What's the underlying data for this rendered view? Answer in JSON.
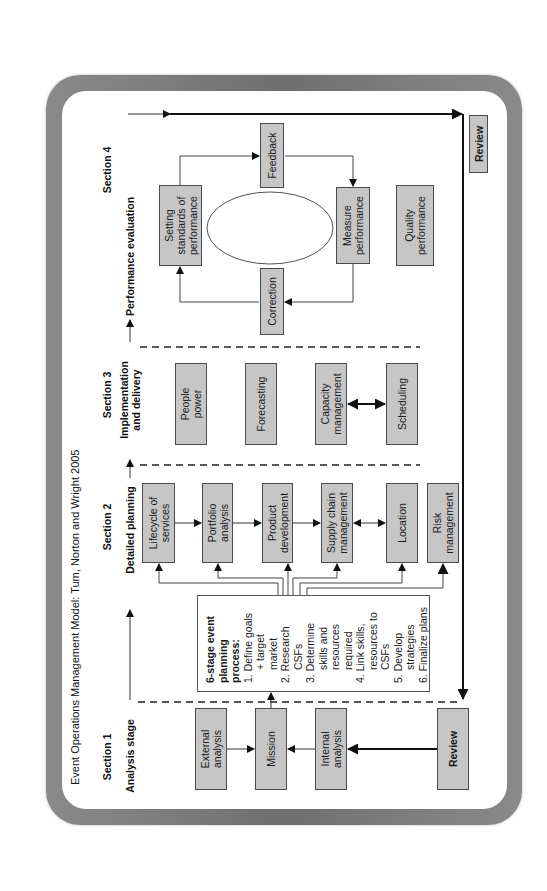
{
  "title": "Event Operations Management Model: Tum, Norton and Wright 2005",
  "sections": [
    {
      "label": "Section 1",
      "stage": "Analysis stage"
    },
    {
      "label": "Section 2",
      "stage": "Detailed planning"
    },
    {
      "label": "Section 3",
      "stage_line1": "Implementation",
      "stage_line2": "and delivery"
    },
    {
      "label": "Section 4",
      "stage": "Performance evaluation"
    }
  ],
  "section1": {
    "boxes": [
      {
        "line1": "External",
        "line2": "analysis"
      },
      {
        "line1": "Mission"
      },
      {
        "line1": "Internal",
        "line2": "analysis"
      },
      {
        "line1": "Review"
      }
    ]
  },
  "planning_process": {
    "heading_line1": "6-stage event",
    "heading_line2": "planning",
    "heading_line3": "process:",
    "steps": [
      {
        "num": "1.",
        "text": "Define goals + target market"
      },
      {
        "num": "2.",
        "text": "Research CSFs"
      },
      {
        "num": "3.",
        "text": "Determine skills and resources required"
      },
      {
        "num": "4.",
        "text": "Link skills, resources to CSFs"
      },
      {
        "num": "5.",
        "text": "Develop strategies"
      },
      {
        "num": "6.",
        "text": "Finalize plans"
      }
    ]
  },
  "section2": {
    "boxes": [
      {
        "line1": "Lifecycle of",
        "line2": "services"
      },
      {
        "line1": "Portfolio",
        "line2": "analysis"
      },
      {
        "line1": "Product",
        "line2": "development"
      },
      {
        "line1": "Supply chain",
        "line2": "management"
      },
      {
        "line1": "Location"
      },
      {
        "line1": "Risk",
        "line2": "management"
      }
    ]
  },
  "section3": {
    "boxes": [
      {
        "line1": "People",
        "line2": "power"
      },
      {
        "line1": "Forecasting"
      },
      {
        "line1": "Capacity",
        "line2": "management"
      },
      {
        "line1": "Scheduling"
      }
    ]
  },
  "section4": {
    "boxes": {
      "setting": {
        "line1": "Setting",
        "line2": "standards of",
        "line3": "performance"
      },
      "feedback": {
        "line1": "Feedback"
      },
      "measure": {
        "line1": "Measure",
        "line2": "performance"
      },
      "correction": {
        "line1": "Correction"
      },
      "quality": {
        "line1": "Quality",
        "line2": "performance"
      },
      "review": {
        "line1": "Review"
      }
    }
  },
  "colors": {
    "box_fill": "#c6c6c6",
    "box_border": "#4a4a4a",
    "frame": "#7a7a7a",
    "background": "#ffffff"
  }
}
